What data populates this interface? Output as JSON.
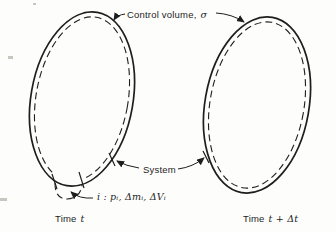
{
  "colors": {
    "paper": "#fdfdfb",
    "ink": "#1e1e1e"
  },
  "figure": {
    "control_volume_label": {
      "text": "Control volume,",
      "symbol": "σ"
    },
    "system_label": "System",
    "element_label": "i : pᵢ, Δmᵢ, ΔVᵢ",
    "caption_left": {
      "text": "Time",
      "symbol": "t"
    },
    "caption_right": {
      "text": "Time",
      "symbol": "t + Δt"
    }
  }
}
